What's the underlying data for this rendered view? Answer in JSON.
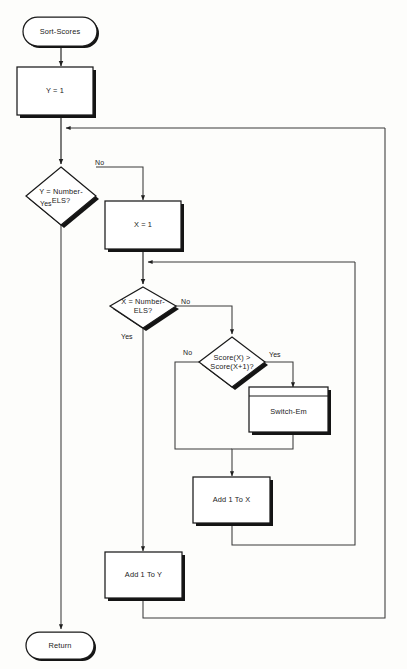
{
  "diagram": {
    "title": "Sort-Scores",
    "type": "flowchart",
    "canvas": {
      "width": 407,
      "height": 669,
      "background": "#fdfdfb"
    },
    "stroke_color": "#1a1a1a",
    "shadow_color": "#141414",
    "fill_color": "#ffffff"
  },
  "nodes": {
    "start": {
      "label": "Sort-Scores",
      "shape": "terminator"
    },
    "init_y": {
      "label": "Y = 1",
      "shape": "process"
    },
    "decide_y": {
      "label_line1": "Y = Number-",
      "label_line2": "ELS?",
      "shape": "decision"
    },
    "init_x": {
      "label": "X = 1",
      "shape": "process"
    },
    "decide_x": {
      "label_line1": "X = Number-",
      "label_line2": "ELS?",
      "shape": "decision"
    },
    "decide_score": {
      "label_line1": "Score(X) >",
      "label_line2": "Score(X+1)?",
      "shape": "decision"
    },
    "switch_em": {
      "label": "Switch-Em",
      "shape": "predefined-process"
    },
    "add_x": {
      "label": "Add 1 To X",
      "shape": "process"
    },
    "add_y": {
      "label": "Add 1 To Y",
      "shape": "process"
    },
    "end": {
      "label": "Return",
      "shape": "terminator"
    }
  },
  "edge_labels": {
    "y_no": "No",
    "y_yes": "Yes",
    "x_no": "No",
    "x_yes": "Yes",
    "score_no": "No",
    "score_yes": "Yes"
  }
}
